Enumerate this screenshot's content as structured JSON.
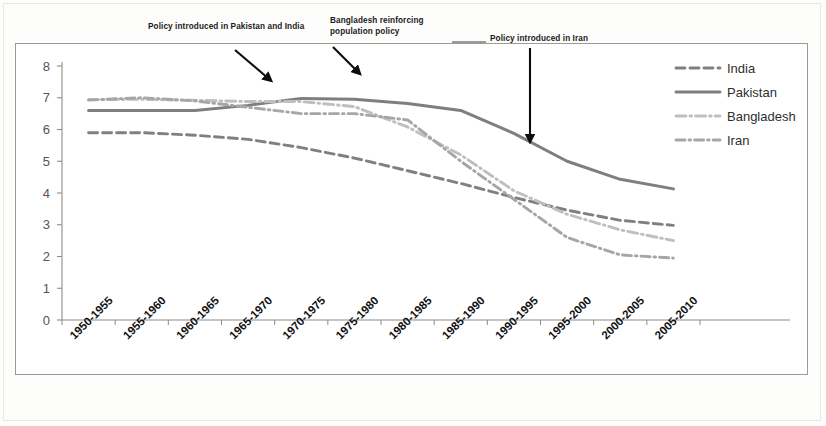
{
  "chart_data": {
    "type": "line",
    "title": "",
    "subtitle": "",
    "xlabel": "",
    "ylabel": "",
    "ylim": [
      0,
      8
    ],
    "ytick_step": 1,
    "grid": false,
    "legend_position": "top-right",
    "categories": [
      "1950-1955",
      "1955-1960",
      "1960-1965",
      "1965-1970",
      "1970-1975",
      "1975-1980",
      "1980-1985",
      "1985-1990",
      "1990-1995",
      "1995-2000",
      "2000-2005",
      "2005-2010"
    ],
    "yticks": [
      "0",
      "1",
      "2",
      "3",
      "4",
      "5",
      "6",
      "7",
      "8"
    ],
    "series": [
      {
        "name": "India",
        "style": "dashed",
        "color": "#808080",
        "values": [
          5.9,
          5.9,
          5.82,
          5.69,
          5.43,
          5.1,
          4.7,
          4.3,
          3.86,
          3.46,
          3.14,
          2.98
        ]
      },
      {
        "name": "Pakistan",
        "style": "solid",
        "color": "#7f7f7f",
        "values": [
          6.6,
          6.6,
          6.6,
          6.76,
          6.98,
          6.95,
          6.82,
          6.6,
          5.88,
          5.0,
          4.43,
          4.13
        ]
      },
      {
        "name": "Bangladesh",
        "style": "dash-dot-light",
        "color": "#bfbfbf",
        "values": [
          6.94,
          6.95,
          6.92,
          6.88,
          6.88,
          6.72,
          6.08,
          5.2,
          4.07,
          3.33,
          2.84,
          2.5
        ]
      },
      {
        "name": "Iran",
        "style": "dash-dot",
        "color": "#a6a6a6",
        "values": [
          6.93,
          7.0,
          6.9,
          6.7,
          6.5,
          6.5,
          6.3,
          5.0,
          3.8,
          2.6,
          2.05,
          1.95
        ]
      }
    ],
    "annotations": [
      {
        "id": "policy-pakistan-india",
        "text": "Policy introduced in Pakistan and India",
        "arrow": "diagonal",
        "points_at_category": "1965-1970"
      },
      {
        "id": "bangladesh-population-policy",
        "text": "Bangladesh reinforcing\npopulation policy",
        "arrow": "diagonal",
        "points_at_category": "1975-1980"
      },
      {
        "id": "policy-iran",
        "text": "Policy introduced in Iran",
        "arrow": "vertical",
        "points_at_category": "1990-1995"
      }
    ]
  },
  "legend": {
    "items": [
      {
        "label": "India"
      },
      {
        "label": "Pakistan"
      },
      {
        "label": "Bangladesh"
      },
      {
        "label": "Iran"
      }
    ]
  }
}
